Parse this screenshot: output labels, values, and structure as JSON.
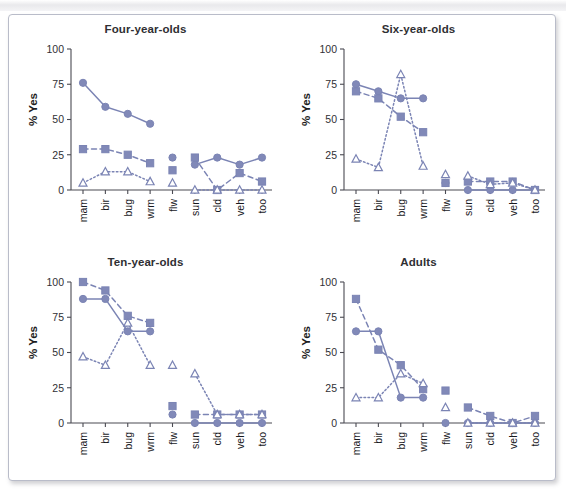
{
  "figure": {
    "background": "#ffffff",
    "frame_border_color": "#b9bcc9",
    "series_color": "#7b84b4",
    "series_fill": "#8189b8",
    "axis_color": "#4a4a52"
  },
  "axes": {
    "y_label": "% Yes",
    "y_ticks": [
      "0",
      "25",
      "50",
      "75",
      "100"
    ],
    "y_min": 0,
    "y_max": 100,
    "x_categories": [
      "mam",
      "bir",
      "bug",
      "wrm",
      "flw",
      "sun",
      "cld",
      "veh",
      "too"
    ]
  },
  "panels": [
    {
      "title": "Four-year-olds"
    },
    {
      "title": "Six-year-olds"
    },
    {
      "title": "Ten-year-olds"
    },
    {
      "title": "Adults"
    }
  ],
  "chart_data": [
    {
      "type": "line",
      "title": "Four-year-olds",
      "xlabel": "",
      "ylabel": "% Yes",
      "ylim": [
        0,
        100
      ],
      "grid": false,
      "legend": "none",
      "categories": [
        "mam",
        "bir",
        "bug",
        "wrm",
        "flw",
        "sun",
        "cld",
        "veh",
        "too"
      ],
      "series": [
        {
          "name": "circle-solid",
          "marker": "circle",
          "line": "solid",
          "values": [
            76,
            59,
            54,
            47,
            23,
            18,
            23,
            18,
            23
          ],
          "segments": [
            [
              0,
              1,
              2,
              3
            ],
            [
              5,
              6,
              7,
              8
            ]
          ]
        },
        {
          "name": "square-dashed",
          "marker": "square",
          "line": "dashed",
          "values": [
            29,
            29,
            25,
            19,
            14,
            23,
            0,
            12,
            6
          ],
          "segments": [
            [
              0,
              1,
              2,
              3
            ],
            [
              5,
              6,
              7,
              8
            ]
          ]
        },
        {
          "name": "triangle-dotted",
          "marker": "triangle",
          "line": "dotted",
          "values": [
            5,
            13,
            13,
            6,
            5,
            0,
            0,
            0,
            0
          ],
          "segments": [
            [
              0,
              1,
              2,
              3
            ],
            [
              5,
              6,
              7,
              8
            ]
          ]
        }
      ]
    },
    {
      "type": "line",
      "title": "Six-year-olds",
      "xlabel": "",
      "ylabel": "% Yes",
      "ylim": [
        0,
        100
      ],
      "grid": false,
      "legend": "none",
      "categories": [
        "mam",
        "bir",
        "bug",
        "wrm",
        "flw",
        "sun",
        "cld",
        "veh",
        "too"
      ],
      "series": [
        {
          "name": "circle-solid",
          "marker": "circle",
          "line": "solid",
          "values": [
            75,
            70,
            65,
            65,
            5,
            0,
            0,
            0,
            0
          ],
          "segments": [
            [
              0,
              1,
              2,
              3
            ],
            [
              5,
              6,
              7,
              8
            ]
          ]
        },
        {
          "name": "square-dashed",
          "marker": "square",
          "line": "dashed",
          "values": [
            70,
            65,
            52,
            41,
            5,
            6,
            6,
            6,
            0
          ],
          "segments": [
            [
              0,
              1,
              2,
              3
            ],
            [
              5,
              6,
              7,
              8
            ]
          ]
        },
        {
          "name": "triangle-dotted",
          "marker": "triangle",
          "line": "dotted",
          "values": [
            22,
            16,
            82,
            17,
            11,
            10,
            4,
            5,
            0
          ],
          "segments": [
            [
              0,
              1,
              2,
              3
            ],
            [
              5,
              6,
              7,
              8
            ]
          ]
        }
      ]
    },
    {
      "type": "line",
      "title": "Ten-year-olds",
      "xlabel": "",
      "ylabel": "% Yes",
      "ylim": [
        0,
        100
      ],
      "grid": false,
      "legend": "none",
      "categories": [
        "mam",
        "bir",
        "bug",
        "wrm",
        "flw",
        "sun",
        "cld",
        "veh",
        "too"
      ],
      "series": [
        {
          "name": "circle-solid",
          "marker": "circle",
          "line": "solid",
          "values": [
            88,
            88,
            65,
            65,
            6,
            0,
            0,
            0,
            0
          ],
          "segments": [
            [
              0,
              1,
              2,
              3
            ],
            [
              5,
              6,
              7,
              8
            ]
          ]
        },
        {
          "name": "square-dashed",
          "marker": "square",
          "line": "dashed",
          "values": [
            100,
            94,
            76,
            71,
            12,
            6,
            6,
            6,
            6
          ],
          "segments": [
            [
              0,
              1,
              2,
              3
            ],
            [
              5,
              6,
              7,
              8
            ]
          ]
        },
        {
          "name": "triangle-dotted",
          "marker": "triangle",
          "line": "dotted",
          "values": [
            47,
            41,
            71,
            41,
            41,
            35,
            6,
            6,
            6
          ],
          "segments": [
            [
              0,
              1,
              2,
              3
            ],
            [
              5,
              6,
              7,
              8
            ]
          ]
        }
      ]
    },
    {
      "type": "line",
      "title": "Adults",
      "xlabel": "",
      "ylabel": "% Yes",
      "ylim": [
        0,
        100
      ],
      "grid": false,
      "legend": "none",
      "categories": [
        "mam",
        "bir",
        "bug",
        "wrm",
        "flw",
        "sun",
        "cld",
        "veh",
        "too"
      ],
      "series": [
        {
          "name": "circle-solid",
          "marker": "circle",
          "line": "solid",
          "values": [
            65,
            65,
            18,
            18,
            0,
            0,
            0,
            0,
            0
          ],
          "segments": [
            [
              0,
              1,
              2,
              3
            ],
            [
              5,
              6,
              7,
              8
            ]
          ]
        },
        {
          "name": "square-dashed",
          "marker": "square",
          "line": "dashed",
          "values": [
            88,
            52,
            41,
            24,
            23,
            11,
            5,
            0,
            5
          ],
          "segments": [
            [
              0,
              1,
              2,
              3
            ],
            [
              5,
              6,
              7,
              8
            ]
          ]
        },
        {
          "name": "triangle-dotted",
          "marker": "triangle",
          "line": "dotted",
          "values": [
            18,
            18,
            35,
            28,
            11,
            0,
            0,
            0,
            0
          ],
          "segments": [
            [
              0,
              1,
              2,
              3
            ],
            [
              5,
              6,
              7,
              8
            ]
          ]
        }
      ]
    }
  ]
}
